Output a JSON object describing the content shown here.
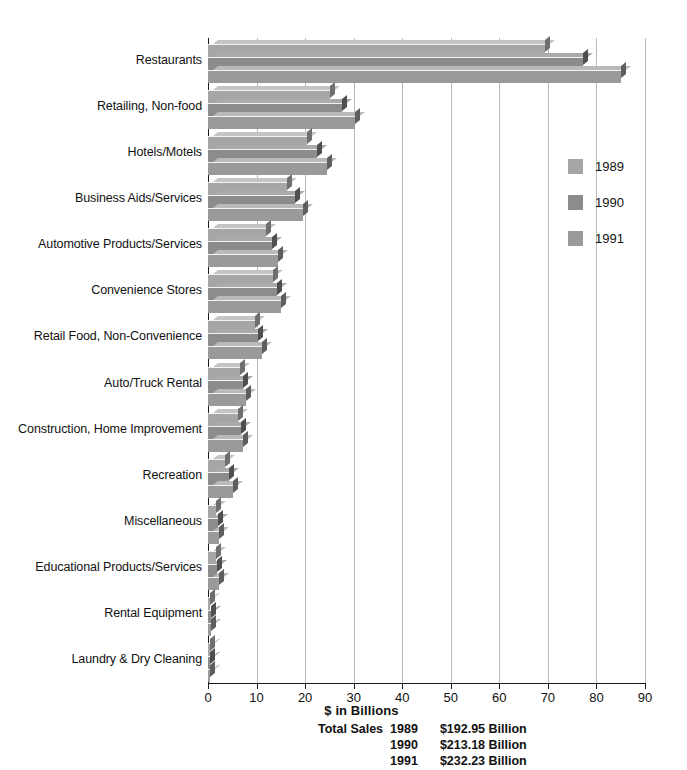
{
  "chart_data": {
    "type": "bar",
    "orientation": "horizontal",
    "title": "",
    "xlabel": "$ in Billions",
    "ylabel": "",
    "xlim": [
      0,
      90
    ],
    "xticks": [
      0,
      10,
      20,
      30,
      40,
      50,
      60,
      70,
      80,
      90
    ],
    "grid": true,
    "legend_position": "right",
    "categories": [
      "Restaurants",
      "Retailing, Non-food",
      "Hotels/Motels",
      "Business Aids/Services",
      "Automotive Products/Services",
      "Convenience Stores",
      "Retail Food, Non-Convenience",
      "Auto/Truck Rental",
      "Construction, Home Improvement",
      "Recreation",
      "Miscellaneous",
      "Educational Products/Services",
      "Rental Equipment",
      "Laundry & Dry Cleaning"
    ],
    "series": [
      {
        "name": "1989",
        "color": "#a6a6a6",
        "values": [
          69.5,
          25.2,
          20.4,
          16.3,
          12.0,
          13.4,
          9.7,
          6.6,
          6.2,
          3.6,
          1.7,
          1.6,
          0.5,
          0.3
        ]
      },
      {
        "name": "1990",
        "color": "#8c8c8c",
        "values": [
          77.3,
          27.6,
          22.4,
          18.0,
          13.2,
          14.2,
          10.3,
          7.2,
          6.8,
          4.4,
          2.0,
          1.9,
          0.6,
          0.35
        ]
      },
      {
        "name": "1991",
        "color": "#9a9a9a",
        "values": [
          85.0,
          30.2,
          24.5,
          19.6,
          14.4,
          15.0,
          11.1,
          7.8,
          7.3,
          5.1,
          2.3,
          2.2,
          0.7,
          0.4
        ]
      }
    ]
  },
  "legend": {
    "items": [
      {
        "label": "1989",
        "swatch": "y1989"
      },
      {
        "label": "1990",
        "swatch": "y1990"
      },
      {
        "label": "1991",
        "swatch": "y1991"
      }
    ]
  },
  "footer": {
    "axis_title": "$ in Billions",
    "totals_caption": "Total Sales",
    "totals": [
      {
        "year": "1989",
        "value": "$192.95 Billion"
      },
      {
        "year": "1990",
        "value": "$213.18 Billion"
      },
      {
        "year": "1991",
        "value": "$232.23 Billion"
      }
    ]
  }
}
